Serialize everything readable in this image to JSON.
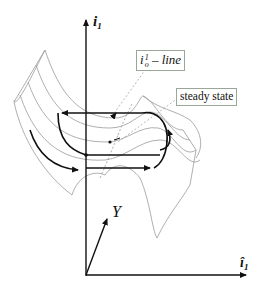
{
  "diagram": {
    "type": "cusp-surface-hysteresis",
    "axes": {
      "vertical": {
        "symbol": "i",
        "subscript": "1",
        "label": "i1"
      },
      "depth": {
        "symbol": "Y",
        "label": "Y"
      },
      "horizontal": {
        "symbol": "î",
        "subscript": "1",
        "label": "î1"
      }
    },
    "labels": {
      "iline": {
        "base": "i",
        "sup": "1",
        "sub": "o",
        "suffix": " – line",
        "text": "i_o^1 – line"
      },
      "steady_state": "steady state"
    },
    "colors": {
      "axis": "#111111",
      "surface": "#9a9a9a",
      "arrow": "#111111",
      "label_border": "#9aa69a",
      "background": "#ffffff"
    }
  }
}
